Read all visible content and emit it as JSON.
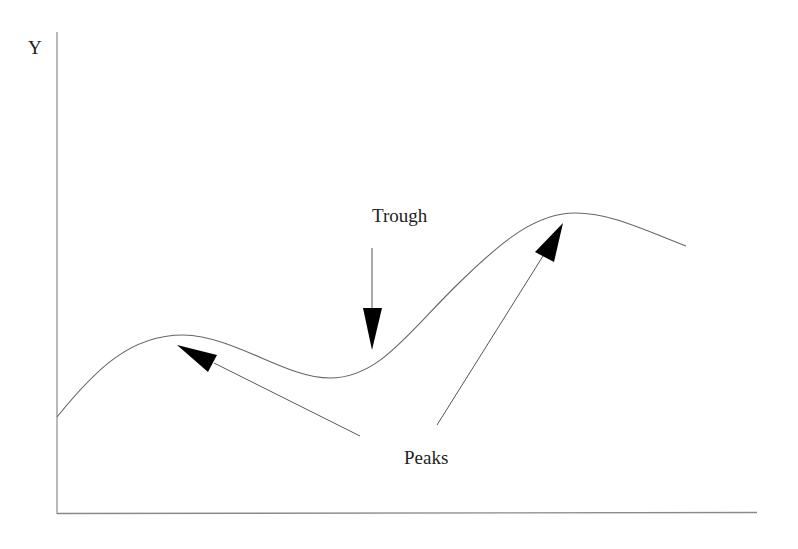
{
  "diagram": {
    "title": "",
    "axes": {
      "y_label": "Y",
      "x_label": "",
      "color": "#888888"
    },
    "annotations": {
      "trough_label": "Trough",
      "peaks_label": "Peaks"
    },
    "curve": {
      "description": "Smooth wave: rises to a first peak, dips to a trough, rises to a higher second peak, then falls slightly",
      "color": "#666666",
      "points": [
        [
          57,
          417
        ],
        [
          90,
          378
        ],
        [
          130,
          347
        ],
        [
          183,
          335
        ],
        [
          230,
          345
        ],
        [
          290,
          372
        ],
        [
          330,
          378
        ],
        [
          370,
          368
        ],
        [
          420,
          333
        ],
        [
          480,
          270
        ],
        [
          530,
          228
        ],
        [
          575,
          213
        ],
        [
          620,
          222
        ],
        [
          686,
          246
        ]
      ]
    },
    "arrows": [
      {
        "name": "trough-arrow",
        "from": [
          372,
          248
        ],
        "to": [
          372,
          350
        ],
        "points_to": "trough"
      },
      {
        "name": "peak-left-arrow",
        "from": [
          360,
          436
        ],
        "to": [
          177,
          345
        ],
        "points_to": "first peak"
      },
      {
        "name": "peak-right-arrow",
        "from": [
          437,
          425
        ],
        "to": [
          563,
          223
        ],
        "points_to": "second peak"
      }
    ],
    "arrow_color": "#000000"
  }
}
